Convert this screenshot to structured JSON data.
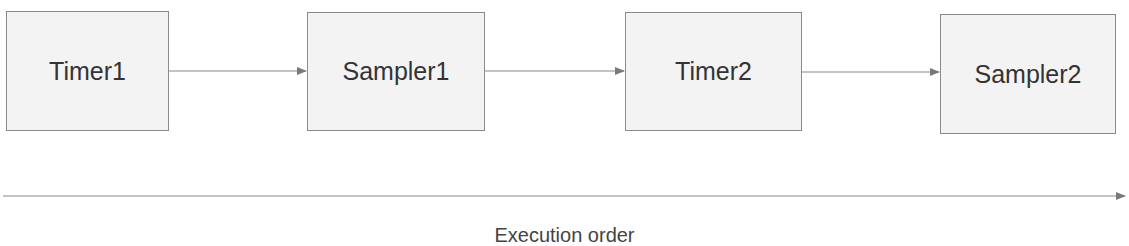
{
  "diagram": {
    "type": "flow",
    "direction": "left-to-right",
    "nodes": [
      {
        "id": "timer1",
        "label": "Timer1"
      },
      {
        "id": "sampler1",
        "label": "Sampler1"
      },
      {
        "id": "timer2",
        "label": "Timer2"
      },
      {
        "id": "sampler2",
        "label": "Sampler2"
      }
    ],
    "edges": [
      {
        "from": "timer1",
        "to": "sampler1"
      },
      {
        "from": "sampler1",
        "to": "timer2"
      },
      {
        "from": "timer2",
        "to": "sampler2"
      }
    ],
    "axis": {
      "label": "Execution order"
    }
  },
  "colors": {
    "node_fill": "#f3f3f3",
    "node_border": "#8a8a8a",
    "line": "#8a8a8a",
    "text": "#333333"
  }
}
